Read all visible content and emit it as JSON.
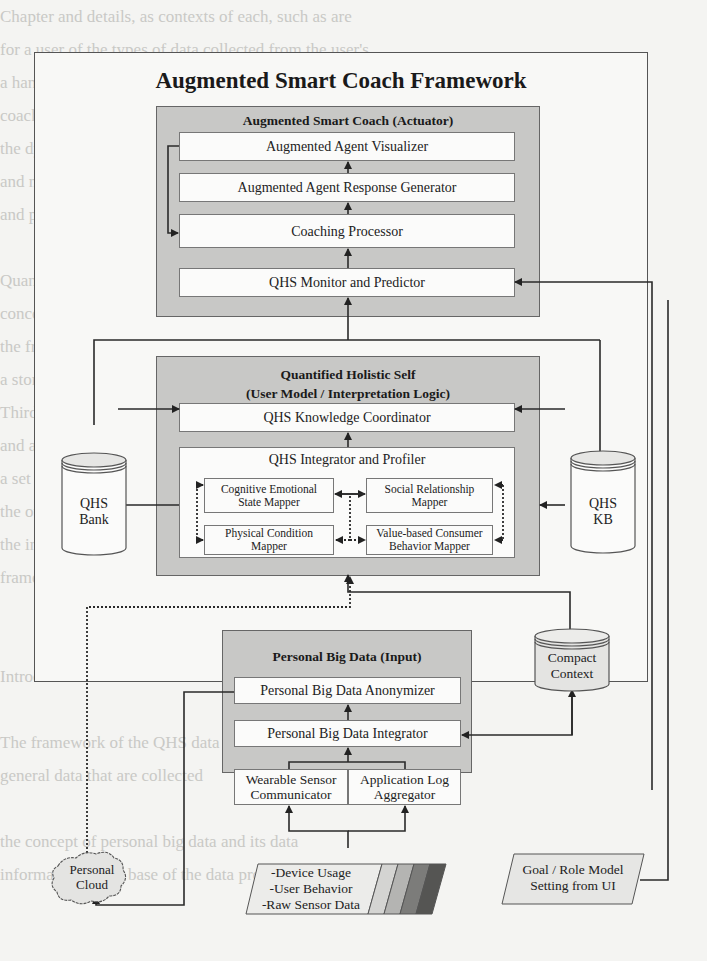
{
  "background_text_lines": [
    "Chapter and details, as contexts of each, such as are",
    "for a user of the types of data collected from the user's",
    "a hands, such information can be treated consistently or",
    "coaching of the program, where we have been treated",
    "the dynamic adaptability and management the coaching",
    "and manage interpretation approaches are handled consistently",
    "and personal data set processing, and these",
    "",
    "Quantified Holistic Self, as the center of a program",
    "concepts as the knowledge base that covers each aspect",
    "the framework stores the reference data collected to",
    "a store of a set of data for the goal and a model and",
    "Third, the interpretation that is used for user interaction",
    "and a set of mental attributes and the context",
    "a set of self-knowledge, and a single as well as",
    "the other models, and a holistic, that is",
    "the interpretation of the overall self as a",
    "framework, the components play",
    "",
    "",
    "Introduction",
    "",
    "The framework of the QHS data based on the",
    "general data that are collected",
    "",
    "the concept of personal big data and its data",
    "information as the base of the data processed"
  ],
  "framework": {
    "title": "Augmented Smart Coach Framework"
  },
  "actuator": {
    "title": "Augmented Smart Coach (Actuator)",
    "components": [
      "Augmented Agent Visualizer",
      "Augmented Agent Response Generator",
      "Coaching Processor",
      "QHS Monitor and Predictor"
    ]
  },
  "qhs": {
    "title_line1": "Quantified Holistic Self",
    "title_line2": "(User Model / Interpretation Logic)",
    "knowledge_coordinator": "QHS Knowledge Coordinator",
    "integrator": "QHS Integrator and Profiler",
    "mappers": [
      {
        "line1": "Cognitive Emotional",
        "line2": "State Mapper"
      },
      {
        "line1": "Social Relationship",
        "line2": "Mapper"
      },
      {
        "line1": "Physical Condition",
        "line2": "Mapper"
      },
      {
        "line1": "Value-based Consumer",
        "line2": "Behavior Mapper"
      }
    ]
  },
  "stores": {
    "qhs_bank": {
      "line1": "QHS",
      "line2": "Bank"
    },
    "qhs_kb": {
      "line1": "QHS",
      "line2": "KB"
    },
    "compact_context": {
      "line1": "Compact",
      "line2": "Context"
    }
  },
  "input": {
    "title": "Personal Big Data (Input)",
    "anonymizer": "Personal Big Data Anonymizer",
    "integrator": "Personal Big Data Integrator",
    "wearable": {
      "line1": "Wearable Sensor",
      "line2": "Communicator"
    },
    "applog": {
      "line1": "Application Log",
      "line2": "Aggregator"
    }
  },
  "external": {
    "personal_cloud": {
      "line1": "Personal",
      "line2": "Cloud"
    },
    "raw_data": [
      "-Device Usage",
      "-User Behavior",
      "-Raw Sensor Data"
    ],
    "goal_ui": {
      "line1": "Goal / Role Model",
      "line2": "Setting from UI"
    }
  },
  "colors": {
    "panel_fill": "#c8c8c6",
    "box_fill": "#fbfbfa",
    "line": "#2a2a2a",
    "stripe_colors": [
      "#d4d4d2",
      "#b4b4b2",
      "#7c7c7a",
      "#555553"
    ]
  }
}
